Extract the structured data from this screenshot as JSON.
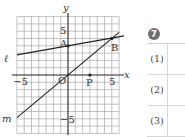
{
  "graph": {
    "axis_labels": {
      "x": "x",
      "y": "y"
    },
    "origin_label": "O",
    "tick_labels": {
      "x_neg": "−5",
      "x_pos": "5",
      "y_pos": "5",
      "y_neg": "−5"
    },
    "points": [
      {
        "name": "A",
        "x": 0,
        "y": 4
      },
      {
        "name": "B",
        "x": 6,
        "y": 5
      },
      {
        "name": "P",
        "x": 3,
        "y": 0
      }
    ],
    "lines": [
      {
        "name": "ℓ",
        "equation": "y = x/6 + 4"
      },
      {
        "name": "m",
        "equation": "y = 5x/6"
      }
    ],
    "range": {
      "x": [
        -7,
        7
      ],
      "y": [
        -8,
        8
      ]
    }
  },
  "panel": {
    "problem_number": "7",
    "rows": [
      {
        "label": "(1)",
        "answer": ""
      },
      {
        "label": "(2)",
        "answer": ""
      },
      {
        "label": "(3)",
        "answer": ""
      }
    ]
  }
}
